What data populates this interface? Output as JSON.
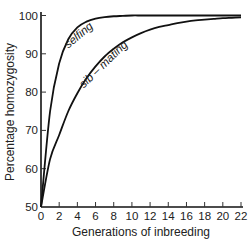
{
  "chart_data": {
    "type": "line",
    "title": "",
    "xlabel": "Generations of inbreeding",
    "ylabel": "Percentage homozygosity",
    "xlim": [
      0,
      22
    ],
    "ylim": [
      50,
      100
    ],
    "grid": false,
    "legend": "inline curve labels",
    "x_ticks": [
      0,
      2,
      4,
      6,
      8,
      10,
      12,
      14,
      16,
      18,
      20,
      22
    ],
    "y_ticks": [
      50,
      60,
      70,
      80,
      90,
      100
    ],
    "x": [
      0,
      1,
      2,
      3,
      4,
      5,
      6,
      7,
      8,
      9,
      10,
      11,
      12,
      13,
      14,
      15,
      16,
      17,
      18,
      19,
      20,
      21,
      22
    ],
    "series": [
      {
        "name": "selfing",
        "values": [
          50,
          75,
          87.5,
          93.8,
          96.9,
          98.4,
          99.2,
          99.6,
          99.8,
          99.9,
          100,
          100,
          100,
          100,
          100,
          100,
          100,
          100,
          100,
          100,
          100,
          100,
          100
        ]
      },
      {
        "name": "sib – mating",
        "values": [
          50,
          62.5,
          68.8,
          75,
          79.7,
          83.6,
          86.7,
          89.3,
          91.3,
          93.0,
          94.3,
          95.4,
          96.3,
          97.0,
          97.5,
          98.0,
          98.4,
          98.7,
          98.9,
          99.1,
          99.3,
          99.4,
          99.5
        ]
      }
    ],
    "annotations": [
      {
        "text": "selfing",
        "near_x": 4,
        "near_y": 95
      },
      {
        "text": "sib – mating",
        "near_x": 7,
        "near_y": 88
      }
    ]
  },
  "labels": {
    "xlabel": "Generations of inbreeding",
    "ylabel": "Percentage homozygosity",
    "selfing": "selfing",
    "sib": "sib – mating"
  }
}
